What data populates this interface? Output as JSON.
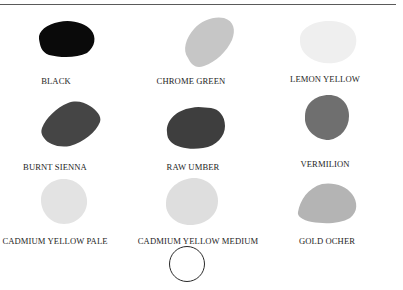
{
  "swatches": [
    {
      "label": "BLACK",
      "color": "#0a0a0a"
    },
    {
      "label": "CHROME GREEN",
      "color": "#c6c6c6"
    },
    {
      "label": "LEMON YELLOW",
      "color": "#efefef"
    },
    {
      "label": "BURNT SIENNA",
      "color": "#454545"
    },
    {
      "label": "RAW UMBER",
      "color": "#3e3e3e"
    },
    {
      "label": "VERMILION",
      "color": "#6f6f6f"
    },
    {
      "label": "CADMIUM YELLOW PALE",
      "color": "#e3e3e3"
    },
    {
      "label": "CADMIUM YELLOW MEDIUM",
      "color": "#dedede"
    },
    {
      "label": "GOLD OCHER",
      "color": "#b4b4b4"
    }
  ],
  "marker": {
    "shape": "circle",
    "stroke": "#2a2a2a"
  }
}
